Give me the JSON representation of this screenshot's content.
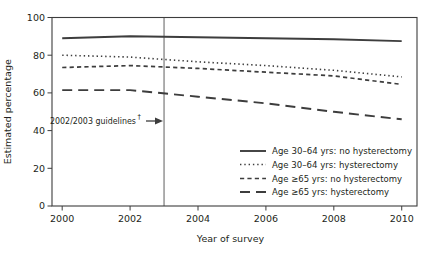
{
  "figure": {
    "background_color": "#ffffff",
    "line_color": "#3d3d3d",
    "text_color": "#231f20",
    "reference_line_color": "#4d4d4d"
  },
  "chart_data": {
    "type": "line",
    "title": "",
    "xlabel": "Year of survey",
    "ylabel": "Estimated percentage",
    "xlim": [
      1999.7,
      2010.45
    ],
    "ylim": [
      0,
      100
    ],
    "x_ticks": [
      2000,
      2002,
      2004,
      2006,
      2008,
      2010
    ],
    "y_ticks": [
      0,
      20,
      40,
      60,
      80,
      100
    ],
    "grid": false,
    "legend_position": "inside-lower-right",
    "x": [
      2000,
      2002,
      2004,
      2006,
      2008,
      2010
    ],
    "series": [
      {
        "name": "Age 30–64 yrs: no hysterectomy",
        "dash": "solid",
        "values": [
          89,
          90,
          89.5,
          89,
          88.5,
          87.5
        ]
      },
      {
        "name": "Age 30–64 yrs: hysterectomy",
        "dash": "dotted",
        "values": [
          80,
          79,
          76.5,
          74.5,
          72,
          68.5
        ]
      },
      {
        "name": "Age ≥65 yrs: no hysterectomy",
        "dash": "short-dash",
        "values": [
          73.5,
          74.5,
          73,
          71,
          69,
          64.5
        ]
      },
      {
        "name": "Age ≥65 yrs: hysterectomy",
        "dash": "long-dash",
        "values": [
          61.5,
          61.5,
          58,
          54.5,
          50,
          46
        ]
      }
    ],
    "reference_line": {
      "x_year": 2003
    },
    "annotation": {
      "text": "2002/2003 guidelines",
      "superscript": "†",
      "arrow": "right-arrow",
      "points_to_year": 2003
    }
  }
}
